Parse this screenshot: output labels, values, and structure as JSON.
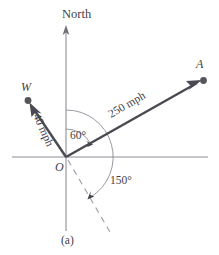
{
  "figure": {
    "caption": "(a)",
    "axis_label_north": "North",
    "origin_label": "O",
    "vectors": [
      {
        "name": "airplane-velocity",
        "point_label": "A",
        "magnitude_label": "250 mph",
        "magnitude": 250,
        "unit": "mph",
        "direction_deg_from_north": 60,
        "tip_x": 203,
        "tip_y": 81
      },
      {
        "name": "wind-velocity",
        "point_label": "W",
        "magnitude_label": "40 mph",
        "magnitude": 40,
        "unit": "mph",
        "direction_deg_from_north": -66,
        "tip_x": 28,
        "tip_y": 100
      }
    ],
    "angles": [
      {
        "name": "angle-60",
        "label": "60°",
        "value": 60,
        "from": "North",
        "to": "A"
      },
      {
        "name": "angle-150",
        "label": "150°",
        "value": 150,
        "from": "North",
        "to": "dashed-reference-line"
      }
    ],
    "colors": {
      "vector": "#4a4a52",
      "axis": "#8d8d96",
      "arc": "#8d8d96",
      "dashed": "#9a9aa2",
      "text": "#3f3f46",
      "background": "#ffffff"
    },
    "origin": {
      "x": 66,
      "y": 157
    }
  }
}
